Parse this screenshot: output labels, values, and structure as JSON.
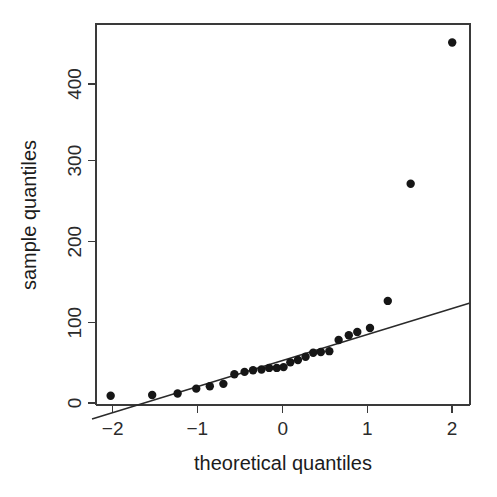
{
  "chart_data": {
    "type": "scatter",
    "title": "",
    "subtitle": "",
    "xlabel": "theoretical quantiles",
    "ylabel": "sample quantiles",
    "xlim": [
      -2.25,
      2.2
    ],
    "ylim": [
      -30,
      470
    ],
    "xticks": [
      -2,
      -1,
      0,
      1,
      2
    ],
    "xtick_labels": [
      "−2",
      "−1",
      "0",
      "1",
      "2"
    ],
    "yticks": [
      0,
      100,
      200,
      300,
      400
    ],
    "ytick_labels": [
      "0",
      "100",
      "200",
      "300",
      "400"
    ],
    "grid": false,
    "legend": false,
    "legend_position": "none",
    "point_color": "#161616",
    "line_color": "#2a2a2a",
    "axis_color": "#3a3a3a",
    "background_color": "#ffffff",
    "point_radius": 4.2,
    "series": [
      {
        "name": "sample quantiles",
        "marker": "filled-circle",
        "x": [
          -2.03,
          -1.54,
          -1.24,
          -1.02,
          -0.86,
          -0.7,
          -0.57,
          -0.45,
          -0.35,
          -0.25,
          -0.16,
          -0.07,
          0.01,
          0.09,
          0.18,
          0.27,
          0.36,
          0.45,
          0.55,
          0.66,
          0.78,
          0.88,
          1.03,
          1.24,
          1.51,
          2.0
        ],
        "y": [
          9,
          10,
          12,
          18,
          21,
          24,
          36,
          39,
          41,
          42,
          44,
          44,
          45,
          51,
          54,
          58,
          63,
          64,
          65,
          79,
          85,
          89,
          94,
          128,
          275,
          452
        ]
      }
    ],
    "reference_line": {
      "name": "qq-reference-line",
      "x": [
        -2.25,
        2.2
      ],
      "y": [
        -20,
        125
      ],
      "slope": 32.6,
      "intercept": 53.3
    },
    "outliers": [
      {
        "x": 1.24,
        "y": 128
      },
      {
        "x": 1.51,
        "y": 275
      },
      {
        "x": 2.0,
        "y": 452
      }
    ]
  },
  "axes": {
    "x_title": "theoretical quantiles",
    "y_title": "sample quantiles"
  }
}
